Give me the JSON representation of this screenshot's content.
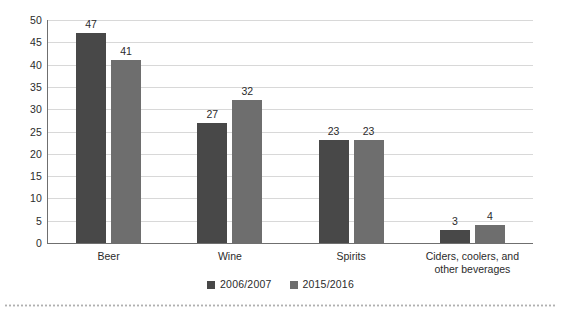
{
  "chart_data": {
    "type": "bar",
    "title": "",
    "subtitle": "",
    "xlabel": "",
    "ylabel": "",
    "ylim": [
      0,
      50
    ],
    "ytick_step": 5,
    "yticks": [
      "50",
      "45",
      "40",
      "35",
      "30",
      "25",
      "20",
      "15",
      "10",
      "5",
      "0"
    ],
    "grid": true,
    "legend_position": "bottom-center",
    "categories": [
      "Beer",
      "Wine",
      "Spirits",
      "Ciders, coolers, and\nother beverages"
    ],
    "series": [
      {
        "name": "2006/2007",
        "color": "#484848",
        "values": [
          47,
          27,
          23,
          3
        ],
        "labels": [
          "47",
          "27",
          "23",
          "3"
        ]
      },
      {
        "name": "2015/2016",
        "color": "#6e6e6e",
        "values": [
          41,
          32,
          23,
          4
        ],
        "labels": [
          "41",
          "32",
          "23",
          "4"
        ]
      }
    ]
  },
  "legend": {
    "items": [
      {
        "label": "2006/2007",
        "color": "#484848"
      },
      {
        "label": "2015/2016",
        "color": "#6e6e6e"
      }
    ]
  },
  "axes": {
    "gridline_color": "#d8d8d8",
    "axis_color": "#6f6f6f"
  },
  "decorations": {
    "bottom_rule_color": "#b0b0b0"
  }
}
